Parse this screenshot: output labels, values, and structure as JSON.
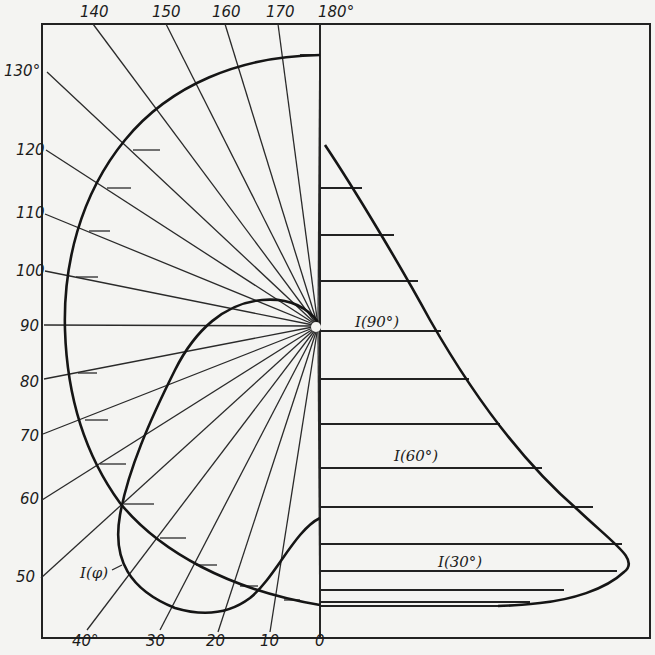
{
  "figure": {
    "type": "polar_and_profile_diagram",
    "frame": {
      "left": 42,
      "top": 24,
      "right": 650,
      "bottom": 638
    },
    "origin": {
      "x": 320,
      "y": 326
    },
    "axis_x": 320
  },
  "angle_labels": {
    "top": [
      {
        "text": "140",
        "x": 80,
        "y": 17
      },
      {
        "text": "150",
        "x": 152,
        "y": 17
      },
      {
        "text": "160",
        "x": 212,
        "y": 17
      },
      {
        "text": "170",
        "x": 266,
        "y": 17
      },
      {
        "text": "180°",
        "x": 318,
        "y": 17
      }
    ],
    "left": [
      {
        "text": "130°",
        "x": 4,
        "y": 76
      },
      {
        "text": "120",
        "x": 16,
        "y": 155
      },
      {
        "text": "110",
        "x": 16,
        "y": 218
      },
      {
        "text": "100",
        "x": 16,
        "y": 276
      },
      {
        "text": "90",
        "x": 20,
        "y": 331
      },
      {
        "text": "80",
        "x": 20,
        "y": 387
      },
      {
        "text": "70",
        "x": 20,
        "y": 441
      },
      {
        "text": "60",
        "x": 20,
        "y": 504
      },
      {
        "text": "50",
        "x": 16,
        "y": 582
      }
    ],
    "bottom": [
      {
        "text": "40°",
        "x": 72,
        "y": 646
      },
      {
        "text": "30",
        "x": 146,
        "y": 646
      },
      {
        "text": "20",
        "x": 206,
        "y": 646
      },
      {
        "text": "10",
        "x": 260,
        "y": 646
      },
      {
        "text": "0",
        "x": 315,
        "y": 646
      }
    ]
  },
  "rays": [
    {
      "angle": 180,
      "end": [
        320,
        24
      ]
    },
    {
      "angle": 170,
      "end": [
        278,
        24
      ]
    },
    {
      "angle": 160,
      "end": [
        225,
        24
      ]
    },
    {
      "angle": 150,
      "end": [
        166,
        24
      ]
    },
    {
      "angle": 140,
      "end": [
        93,
        24
      ]
    },
    {
      "angle": 130,
      "end": [
        47,
        72
      ]
    },
    {
      "angle": 120,
      "end": [
        46,
        150
      ]
    },
    {
      "angle": 110,
      "end": [
        45,
        214
      ]
    },
    {
      "angle": 100,
      "end": [
        45,
        271
      ]
    },
    {
      "angle": 90,
      "end": [
        44,
        325
      ]
    },
    {
      "angle": 80,
      "end": [
        44,
        379
      ]
    },
    {
      "angle": 70,
      "end": [
        43,
        434
      ]
    },
    {
      "angle": 60,
      "end": [
        42,
        500
      ]
    },
    {
      "angle": 50,
      "end": [
        41,
        578
      ]
    },
    {
      "angle": 40,
      "end": [
        87,
        630
      ]
    },
    {
      "angle": 30,
      "end": [
        160,
        630
      ]
    },
    {
      "angle": 20,
      "end": [
        218,
        632
      ]
    },
    {
      "angle": 10,
      "end": [
        270,
        632
      ]
    },
    {
      "angle": 0,
      "end": [
        320,
        632
      ]
    }
  ],
  "outer_curve_ticks": [
    {
      "x1": 133,
      "y1": 150,
      "x2": 160,
      "y2": 150
    },
    {
      "x1": 107,
      "y1": 188,
      "x2": 131,
      "y2": 188
    },
    {
      "x1": 89,
      "y1": 231,
      "x2": 110,
      "y2": 231
    },
    {
      "x1": 76,
      "y1": 277,
      "x2": 98,
      "y2": 277
    },
    {
      "x1": 78,
      "y1": 373,
      "x2": 97,
      "y2": 373
    },
    {
      "x1": 85,
      "y1": 420,
      "x2": 108,
      "y2": 420
    },
    {
      "x1": 100,
      "y1": 464,
      "x2": 126,
      "y2": 464
    },
    {
      "x1": 124,
      "y1": 504,
      "x2": 154,
      "y2": 504
    },
    {
      "x1": 160,
      "y1": 538,
      "x2": 186,
      "y2": 538
    },
    {
      "x1": 196,
      "y1": 565,
      "x2": 217,
      "y2": 565
    },
    {
      "x1": 240,
      "y1": 586,
      "x2": 258,
      "y2": 586
    },
    {
      "x1": 284,
      "y1": 600,
      "x2": 300,
      "y2": 600
    }
  ],
  "profile_bars": [
    {
      "y": 55,
      "x_end": 320
    },
    {
      "y": 188,
      "x_end": 362
    },
    {
      "y": 235,
      "x_end": 394
    },
    {
      "y": 281,
      "x_end": 418
    },
    {
      "y": 331,
      "x_end": 441
    },
    {
      "y": 379,
      "x_end": 469
    },
    {
      "y": 424,
      "x_end": 500
    },
    {
      "y": 468,
      "x_end": 542
    },
    {
      "y": 507,
      "x_end": 593
    },
    {
      "y": 544,
      "x_end": 622
    },
    {
      "y": 571,
      "x_end": 617
    },
    {
      "y": 590,
      "x_end": 564
    },
    {
      "y": 602,
      "x_end": 530
    },
    {
      "y": 606,
      "x_end": 505
    }
  ],
  "curve_labels": [
    {
      "id": "i-phi",
      "text": "I(φ)",
      "x": 80,
      "y": 578
    },
    {
      "id": "i-90",
      "text": "I(90°)",
      "x": 355,
      "y": 327
    },
    {
      "id": "i-60",
      "text": "I(60°)",
      "x": 394,
      "y": 461
    },
    {
      "id": "i-30",
      "text": "I(30°)",
      "x": 438,
      "y": 567
    }
  ],
  "paths": {
    "outer_arc": "M320,55 C240,56 170,85 125,140 C80,195 63,265 65,330 C67,395 85,455 120,503 C160,552 230,590 320,605",
    "inner_loop": "M318,322 C305,305 285,298 262,300 C225,303 195,330 175,370 C150,420 128,470 120,515 C112,560 130,590 175,608 C205,617 230,613 250,598 C275,578 295,530 320,518",
    "profile_curve": "M325,145 C355,190 400,265 430,320 C470,390 520,460 578,510 C615,545 640,560 624,572 C605,590 570,600 540,603 C520,605 505,606 498,606"
  },
  "colors": {
    "background": "#f4f4f2",
    "ink": "#1c1c1c"
  }
}
